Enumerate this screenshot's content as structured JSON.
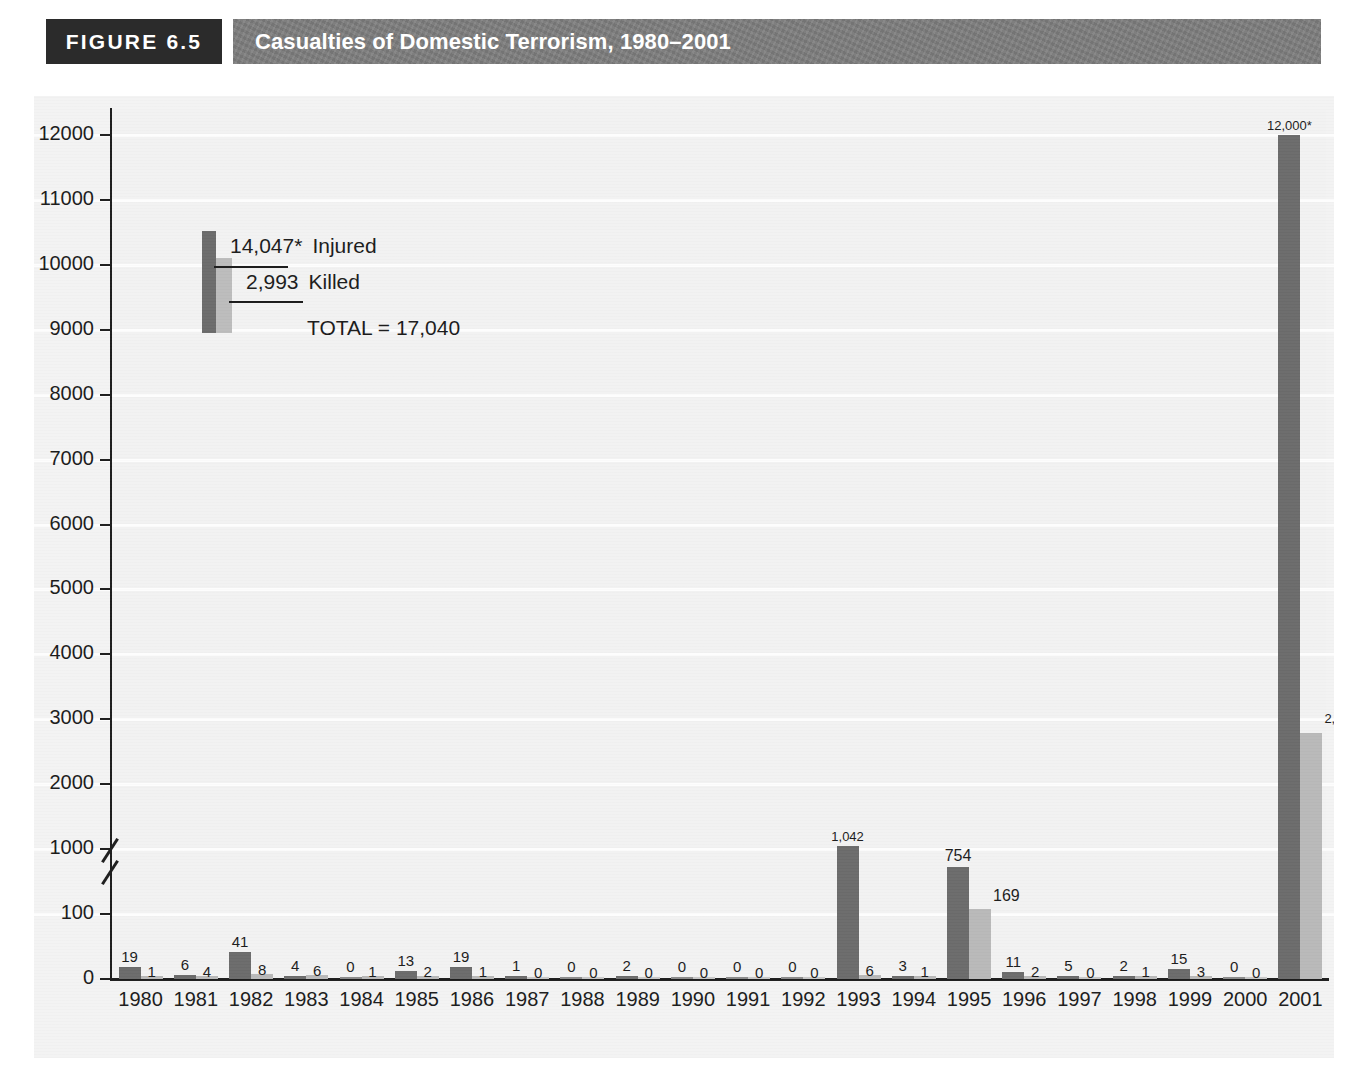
{
  "header": {
    "figure_number": "FIGURE 6.5",
    "title": "Casualties of Domestic Terrorism, 1980–2001",
    "number_box_color": "#2b2b2b",
    "title_box_color": "#7d7d7d"
  },
  "legend": {
    "injured_value": "14,047*",
    "injured_label": "Injured",
    "killed_value": "2,993",
    "killed_label": "Killed",
    "total_text": "TOTAL = 17,040",
    "injured_color": "#6b6b6b",
    "killed_color": "#b9b9b9"
  },
  "chart_data": {
    "type": "bar",
    "title": "Casualties of Domestic Terrorism, 1980–2001",
    "xlabel": "",
    "ylabel": "",
    "grid": true,
    "legend_position": "inside-top-left",
    "axis_broken": true,
    "axis_break_between": [
      100,
      1000
    ],
    "ytick_labels": [
      "0",
      "100",
      "1000",
      "2000",
      "3000",
      "4000",
      "5000",
      "6000",
      "7000",
      "8000",
      "9000",
      "10000",
      "11000",
      "12000"
    ],
    "ylim": [
      0,
      12000
    ],
    "categories": [
      "1980",
      "1981",
      "1982",
      "1983",
      "1984",
      "1985",
      "1986",
      "1987",
      "1988",
      "1989",
      "1990",
      "1991",
      "1992",
      "1993",
      "1994",
      "1995",
      "1996",
      "1997",
      "1998",
      "1999",
      "2000",
      "2001"
    ],
    "series": [
      {
        "name": "Injured",
        "color": "#6b6b6b",
        "values": [
          19,
          6,
          41,
          4,
          0,
          13,
          19,
          1,
          0,
          2,
          0,
          0,
          0,
          1042,
          3,
          754,
          11,
          5,
          2,
          15,
          0,
          12000
        ],
        "labels": [
          "19",
          "6",
          "41",
          "4",
          "0",
          "13",
          "19",
          "1",
          "0",
          "2",
          "0",
          "0",
          "0",
          "1,042",
          "3",
          "754",
          "11",
          "5",
          "2",
          "15",
          "0",
          "12,000*"
        ]
      },
      {
        "name": "Killed",
        "color": "#b9b9b9",
        "values": [
          1,
          4,
          8,
          6,
          1,
          2,
          1,
          0,
          0,
          0,
          0,
          0,
          0,
          6,
          1,
          169,
          2,
          0,
          1,
          3,
          0,
          2788
        ],
        "labels": [
          "1",
          "4",
          "8",
          "6",
          "1",
          "2",
          "1",
          "0",
          "0",
          "0",
          "0",
          "0",
          "0",
          "6",
          "1",
          "169",
          "2",
          "0",
          "1",
          "3",
          "0",
          "2,788"
        ]
      }
    ],
    "totals": {
      "injured": "14,047*",
      "killed": "2,993",
      "total": "17,040"
    }
  }
}
